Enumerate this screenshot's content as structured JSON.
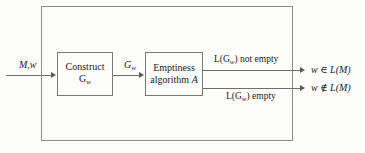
{
  "diagram": {
    "type": "flow-diagram",
    "background_color": "#fdfdfb",
    "line_color": "#6e6e6e",
    "outer_box": {
      "name": "enclosing-procedure-box",
      "border_color": "#8c8c8c"
    },
    "input": {
      "label": "M,w"
    },
    "boxes": [
      {
        "id": "construct",
        "line1": "Construct",
        "line2_base": "G",
        "line2_sub": "w"
      },
      {
        "id": "emptiness",
        "line1": "Emptiness",
        "line2": "algorithm",
        "line2_italic": "A"
      }
    ],
    "intermediate": {
      "base": "G",
      "sub": "w"
    },
    "branches": [
      {
        "id": "not-empty",
        "condition_prefix": "L(G",
        "condition_sub": "w",
        "condition_suffix": ") not empty",
        "result_var": "w",
        "result_relation": "∈",
        "result_set": "L(M)"
      },
      {
        "id": "empty",
        "condition_prefix": "L(G",
        "condition_sub": "w",
        "condition_suffix": ") empty",
        "result_var": "w",
        "result_relation": "∉",
        "result_set": "L(M)"
      }
    ]
  }
}
